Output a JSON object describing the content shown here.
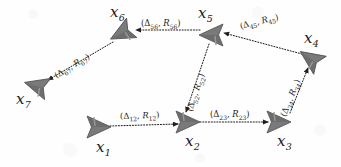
{
  "figure": {
    "background_color": "#fefefe",
    "node_color": "#7a7a7a",
    "node_edge_color": "#4d4d4d",
    "text_color": "#1b1b1b",
    "arrow_style": "dotted"
  },
  "nodes": [
    {
      "id": "x1",
      "label": "x",
      "sub": "1",
      "x": 98,
      "y": 127,
      "label_x": 96,
      "label_y": 140,
      "heading_deg": 0,
      "icon": "robot-glyph"
    },
    {
      "id": "x2",
      "label": "x",
      "sub": "2",
      "x": 187,
      "y": 122,
      "label_x": 185,
      "label_y": 134,
      "heading_deg": 0,
      "icon": "robot-glyph"
    },
    {
      "id": "x3",
      "label": "x",
      "sub": "3",
      "x": 278,
      "y": 122,
      "label_x": 277,
      "label_y": 134,
      "heading_deg": 0,
      "icon": "robot-glyph"
    },
    {
      "id": "x4",
      "label": "x",
      "sub": "4",
      "x": 311,
      "y": 59,
      "label_x": 304,
      "label_y": 31,
      "heading_deg": 215,
      "icon": "robot-glyph"
    },
    {
      "id": "x5",
      "label": "x",
      "sub": "5",
      "x": 212,
      "y": 35,
      "label_x": 198,
      "label_y": 6,
      "heading_deg": 180,
      "icon": "robot-glyph"
    },
    {
      "id": "x6",
      "label": "x",
      "sub": "6",
      "x": 122,
      "y": 33,
      "label_x": 110,
      "label_y": 5,
      "heading_deg": 152,
      "icon": "robot-glyph"
    },
    {
      "id": "x7",
      "label": "x",
      "sub": "7",
      "x": 37,
      "y": 86,
      "label_x": 16,
      "label_y": 92,
      "heading_deg": 196,
      "icon": "robot-glyph"
    }
  ],
  "edges": [
    {
      "id": "e12",
      "from": "x1",
      "to": "x2",
      "x1": 110,
      "y1": 126,
      "x2": 178,
      "y2": 124,
      "label_delta": "Δ12",
      "label_r": "R12",
      "label_text": "(Δ12, R12)",
      "label_x": 120,
      "label_y": 112,
      "label_rot": -2
    },
    {
      "id": "e23",
      "from": "x2",
      "to": "x3",
      "x1": 200,
      "y1": 122,
      "x2": 268,
      "y2": 122,
      "label_delta": "Δ23",
      "label_r": "R23",
      "label_text": "(Δ23, R23)",
      "label_x": 210,
      "label_y": 110,
      "label_rot": 0
    },
    {
      "id": "e34",
      "from": "x3",
      "to": "x4",
      "x1": 290,
      "y1": 113,
      "x2": 308,
      "y2": 68,
      "label_delta": "Δ34",
      "label_r": "R34",
      "label_text": "(Δ34, R34)",
      "label_x": 283,
      "label_y": 112,
      "label_rot": -68
    },
    {
      "id": "e45",
      "from": "x4",
      "to": "x5",
      "x1": 302,
      "y1": 54,
      "x2": 224,
      "y2": 33,
      "label_delta": "Δ45",
      "label_r": "R45",
      "label_text": "(Δ45, R45)",
      "label_x": 240,
      "label_y": 22,
      "label_rot": -14
    },
    {
      "id": "e56",
      "from": "x5",
      "to": "x6",
      "x1": 200,
      "y1": 30,
      "x2": 136,
      "y2": 30,
      "label_delta": "Δ56",
      "label_r": "R56",
      "label_text": "(Δ56, R56)",
      "label_x": 141,
      "label_y": 19,
      "label_rot": 0
    },
    {
      "id": "e67",
      "from": "x6",
      "to": "x7",
      "x1": 113,
      "y1": 42,
      "x2": 48,
      "y2": 80,
      "label_delta": "Δ67",
      "label_r": "R67",
      "label_text": "(Δ67, R67)",
      "label_x": 55,
      "label_y": 72,
      "label_rot": -31
    },
    {
      "id": "e52",
      "from": "x5",
      "to": "x2",
      "x1": 209,
      "y1": 44,
      "x2": 186,
      "y2": 112,
      "label_delta": "Δ52",
      "label_r": "R52",
      "label_text": "(Δ52, R52)",
      "label_x": 189,
      "label_y": 107,
      "label_rot": -71
    }
  ]
}
